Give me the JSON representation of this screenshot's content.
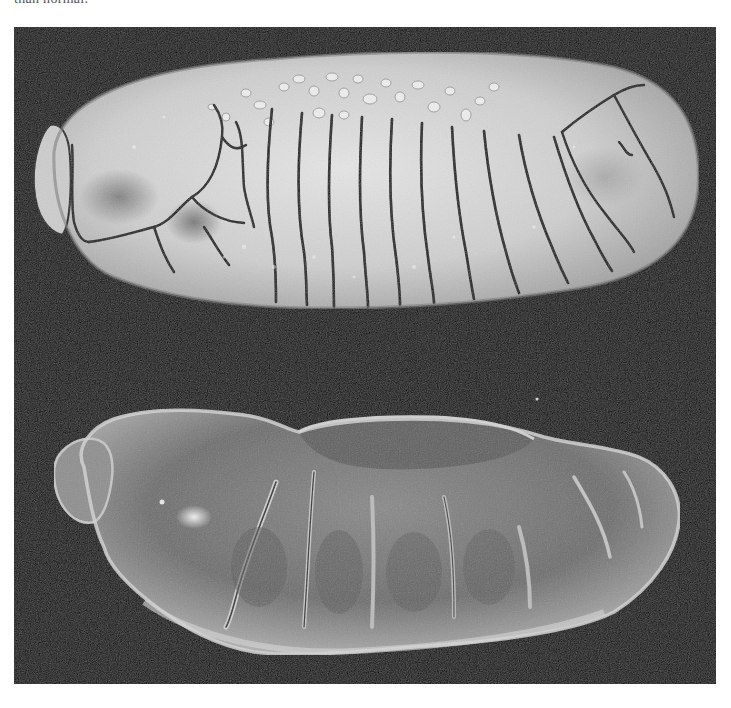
{
  "caption": {
    "fragment_text": "than normal."
  },
  "figure": {
    "panel_background": "#0b0b0b",
    "specimens": [
      {
        "id": "top",
        "description": "Cracked segmented embryo with dorsal nodules",
        "tone": "light-gray"
      },
      {
        "id": "bottom",
        "description": "Smooth segmented embryo, scanning electron micrograph",
        "tone": "medium-gray"
      }
    ]
  }
}
